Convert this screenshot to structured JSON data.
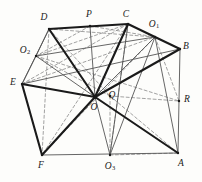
{
  "figure": {
    "width": 202,
    "height": 182,
    "background_color": "#fdfdfb",
    "stroke_color_solid": "#1a1a1a",
    "stroke_color_dashed": "#8a8a8a",
    "stroke_color_thin": "#555555"
  },
  "points": {
    "A": {
      "label": "A",
      "sub": "",
      "x": 178,
      "y": 153,
      "label_x": 181,
      "label_y": 164
    },
    "B": {
      "label": "B",
      "sub": "",
      "x": 180,
      "y": 49,
      "label_x": 186,
      "label_y": 47
    },
    "C": {
      "label": "C",
      "sub": "",
      "x": 128,
      "y": 24,
      "label_x": 126,
      "label_y": 15
    },
    "D": {
      "label": "D",
      "sub": "",
      "x": 49,
      "y": 29,
      "label_x": 44,
      "label_y": 18
    },
    "E": {
      "label": "E",
      "sub": "",
      "x": 22,
      "y": 84,
      "label_x": 13,
      "label_y": 83
    },
    "F": {
      "label": "F",
      "sub": "",
      "x": 42,
      "y": 155,
      "label_x": 41,
      "label_y": 166
    },
    "O": {
      "label": "O",
      "sub": "",
      "x": 95,
      "y": 97,
      "label_x": 94,
      "label_y": 108
    },
    "O1": {
      "label": "O",
      "sub": "1",
      "x": 155,
      "y": 37,
      "label_x": 154,
      "label_y": 25
    },
    "O2": {
      "label": "O",
      "sub": "2",
      "x": 36,
      "y": 56,
      "label_x": 25,
      "label_y": 51
    },
    "O3": {
      "label": "O",
      "sub": "3",
      "x": 110,
      "y": 155,
      "label_x": 110,
      "label_y": 167
    },
    "P": {
      "label": "P",
      "sub": "",
      "x": 90,
      "y": 26,
      "label_x": 89,
      "label_y": 15
    },
    "Q": {
      "label": "Q",
      "sub": "",
      "x": 110,
      "y": 96,
      "label_x": 112,
      "label_y": 96
    },
    "R": {
      "label": "R",
      "sub": "",
      "x": 179,
      "y": 101,
      "label_x": 187,
      "label_y": 100
    }
  },
  "edges_hull_thick": [
    {
      "name": "edge-D-C",
      "from": "D",
      "to": "C"
    },
    {
      "name": "edge-C-O1",
      "from": "C",
      "to": "O1"
    },
    {
      "name": "edge-E-F",
      "from": "E",
      "to": "F"
    },
    {
      "name": "edge-D-O",
      "from": "D",
      "to": "O"
    },
    {
      "name": "edge-C-O",
      "from": "C",
      "to": "O"
    },
    {
      "name": "edge-E-O",
      "from": "E",
      "to": "O"
    },
    {
      "name": "edge-F-O",
      "from": "F",
      "to": "O"
    },
    {
      "name": "edge-O-B",
      "from": "O",
      "to": "B"
    },
    {
      "name": "edge-O-A",
      "from": "O",
      "to": "A"
    },
    {
      "name": "edge-O1-B",
      "from": "O1",
      "to": "B"
    }
  ],
  "edges_thin": [
    {
      "name": "edge-D-E",
      "from": "D",
      "to": "E"
    },
    {
      "name": "edge-O1-B-outline",
      "from": "O1",
      "to": "B"
    },
    {
      "name": "edge-B-A",
      "from": "B",
      "to": "A"
    },
    {
      "name": "edge-F-A",
      "from": "F",
      "to": "A"
    },
    {
      "name": "edge-D-O2",
      "from": "D",
      "to": "O2"
    },
    {
      "name": "edge-O2-E",
      "from": "O2",
      "to": "E"
    },
    {
      "name": "edge-O2-O",
      "from": "O2",
      "to": "O"
    },
    {
      "name": "edge-O2-O1",
      "from": "O2",
      "to": "O1"
    },
    {
      "name": "edge-O1-O",
      "from": "O1",
      "to": "O"
    },
    {
      "name": "edge-O1-A",
      "from": "O1",
      "to": "A"
    },
    {
      "name": "edge-O3-O",
      "from": "O3",
      "to": "O"
    },
    {
      "name": "edge-O3-C",
      "from": "O3",
      "to": "C"
    },
    {
      "name": "edge-O3-O1",
      "from": "O3",
      "to": "O1"
    },
    {
      "name": "edge-P-O",
      "from": "P",
      "to": "O"
    },
    {
      "name": "edge-E-B",
      "from": "E",
      "to": "B"
    }
  ],
  "edges_dashed": [
    {
      "name": "dash-D-F",
      "from": "D",
      "to": "F"
    },
    {
      "name": "dash-D-O1",
      "from": "D",
      "to": "O1"
    },
    {
      "name": "dash-D-Q",
      "from": "D",
      "to": "Q"
    },
    {
      "name": "dash-C-O2",
      "from": "C",
      "to": "O2"
    },
    {
      "name": "dash-C-E",
      "from": "C",
      "to": "E"
    },
    {
      "name": "dash-C-F",
      "from": "C",
      "to": "F"
    },
    {
      "name": "dash-C-O3",
      "from": "C",
      "to": "O3"
    },
    {
      "name": "dash-O2-Q",
      "from": "O2",
      "to": "Q"
    },
    {
      "name": "dash-O2-R",
      "from": "O2",
      "to": "R"
    },
    {
      "name": "dash-E-O1",
      "from": "E",
      "to": "O1"
    },
    {
      "name": "dash-O1-R",
      "from": "O1",
      "to": "R"
    },
    {
      "name": "dash-O1-F",
      "from": "O1",
      "to": "F"
    },
    {
      "name": "dash-Q-R",
      "from": "Q",
      "to": "R"
    },
    {
      "name": "dash-Q-O3",
      "from": "Q",
      "to": "O3"
    },
    {
      "name": "dash-Q-A",
      "from": "Q",
      "to": "A"
    },
    {
      "name": "dash-P-O1",
      "from": "P",
      "to": "O1"
    },
    {
      "name": "dash-P-O2",
      "from": "P",
      "to": "O2"
    },
    {
      "name": "dash-O3-A",
      "from": "O3",
      "to": "A"
    }
  ]
}
